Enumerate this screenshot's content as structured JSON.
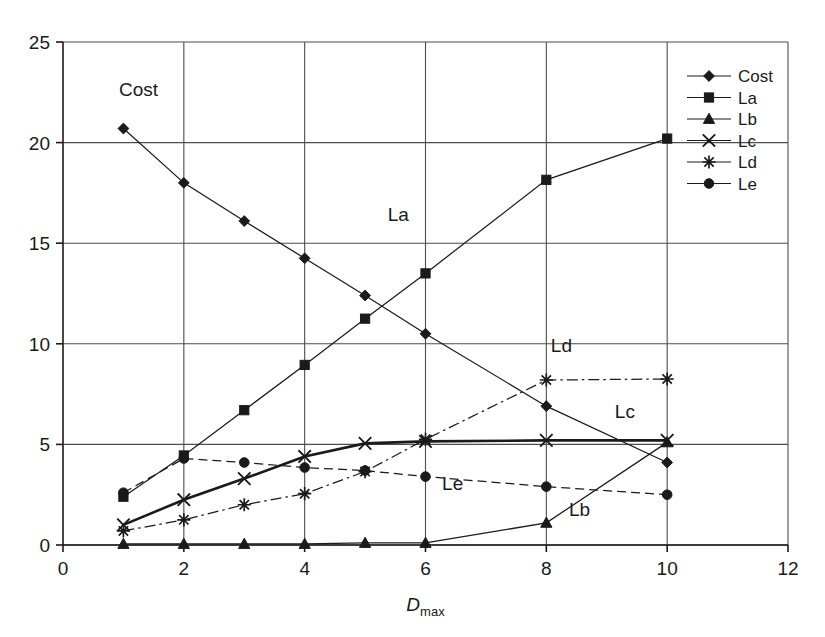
{
  "chart_data": {
    "type": "line",
    "title": "",
    "xlabel": "Dmax",
    "xlabel_base": "D",
    "xlabel_sub": "max",
    "ylabel": "",
    "xlim": [
      0,
      12
    ],
    "ylim": [
      0,
      25
    ],
    "x": [
      1,
      2,
      3,
      4,
      5,
      6,
      8,
      10
    ],
    "xticks": [
      "0",
      "2",
      "4",
      "6",
      "8",
      "10",
      "12"
    ],
    "xtick_values": [
      0,
      2,
      4,
      6,
      8,
      10,
      12
    ],
    "yticks": [
      "0",
      "5",
      "10",
      "15",
      "20",
      "25"
    ],
    "ytick_values": [
      0,
      5,
      10,
      15,
      20,
      25
    ],
    "grid": "both",
    "legend_position": "top-right-inside",
    "series": [
      {
        "name": "Cost",
        "marker": "diamond",
        "line_style": "solid",
        "values": [
          20.7,
          18.0,
          16.1,
          14.25,
          12.4,
          10.5,
          6.9,
          4.1
        ]
      },
      {
        "name": "La",
        "marker": "square",
        "line_style": "solid",
        "values": [
          2.4,
          4.45,
          6.7,
          8.95,
          11.25,
          13.5,
          18.15,
          20.2
        ]
      },
      {
        "name": "Lb",
        "marker": "triangle",
        "line_style": "solid",
        "values": [
          0.05,
          0.05,
          0.05,
          0.05,
          0.1,
          0.1,
          1.1,
          5.1
        ]
      },
      {
        "name": "Lc",
        "marker": "cross",
        "line_style": "solid-thick",
        "values": [
          1.0,
          2.25,
          3.3,
          4.4,
          5.05,
          5.15,
          5.2,
          5.2
        ]
      },
      {
        "name": "Ld",
        "marker": "asterisk",
        "line_style": "dash-dot",
        "values": [
          0.7,
          1.25,
          2.0,
          2.55,
          3.65,
          5.25,
          8.2,
          8.25
        ]
      },
      {
        "name": "Le",
        "marker": "circle",
        "line_style": "dashed",
        "values": [
          2.6,
          4.3,
          4.1,
          3.85,
          3.7,
          3.4,
          2.9,
          2.5
        ]
      }
    ],
    "annotations": [
      {
        "text": "Cost",
        "x": 1.25,
        "y": 22.3
      },
      {
        "text": "La",
        "x": 5.55,
        "y": 16.1
      },
      {
        "text": "Ld",
        "x": 8.25,
        "y": 9.6
      },
      {
        "text": "Lc",
        "x": 9.3,
        "y": 6.3
      },
      {
        "text": "Le",
        "x": 6.45,
        "y": 2.75
      },
      {
        "text": "Lb",
        "x": 8.55,
        "y": 1.45
      }
    ],
    "legend": [
      {
        "label": "Cost",
        "marker": "diamond",
        "line_style": "solid"
      },
      {
        "label": "La",
        "marker": "square",
        "line_style": "solid"
      },
      {
        "label": "Lb",
        "marker": "triangle",
        "line_style": "solid"
      },
      {
        "label": "Lc",
        "marker": "cross",
        "line_style": "solid"
      },
      {
        "label": "Ld",
        "marker": "asterisk",
        "line_style": "solid"
      },
      {
        "label": "Le",
        "marker": "circle",
        "line_style": "solid"
      }
    ],
    "colors": {
      "line": "#1a1a1a",
      "grid": "#4d4d4d",
      "axis": "#1a1a1a",
      "background": "#ffffff",
      "text": "#1a1a1a"
    }
  }
}
